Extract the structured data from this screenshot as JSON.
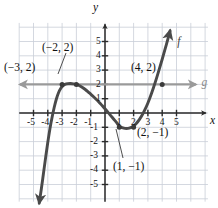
{
  "figure": {
    "background": "#ffffff",
    "width": 218,
    "height": 208
  },
  "axes": {
    "x_name": "x",
    "y_name": "y",
    "origin_px": {
      "x": 105,
      "y": 113
    },
    "unit_px": 14.3,
    "xlim": [
      -6.0,
      7.2
    ],
    "ylim": [
      -6.2,
      6.3
    ],
    "axis_color": "#2b2b2b",
    "grid_color": "#c9ced8",
    "grid": true
  },
  "ticks": {
    "x_labels": [
      "-5",
      "-4",
      "-3",
      "-2",
      "-1",
      "1",
      "2",
      "3",
      "4",
      "5"
    ],
    "x_values": [
      -5,
      -4,
      -3,
      -2,
      -1,
      1,
      2,
      3,
      4,
      5
    ],
    "y_labels": [
      "5",
      "4",
      "3",
      "2",
      "1",
      "-1",
      "-2",
      "-3",
      "-4",
      "-5"
    ],
    "y_values": [
      5,
      4,
      3,
      2,
      1,
      -1,
      -2,
      -3,
      -4,
      -5
    ]
  },
  "curves": {
    "f": {
      "label": "f",
      "color": "#4a4a4a",
      "width": 2.9,
      "label_pos": {
        "x": 5.05,
        "y": 4.95
      },
      "type": "cubic",
      "points": [
        [
          -4.6,
          -6.3
        ],
        [
          -4.45,
          -5.3
        ],
        [
          -4.3,
          -4.2
        ],
        [
          -4.15,
          -3.1
        ],
        [
          -4.0,
          -2.05
        ],
        [
          -3.85,
          -1.1
        ],
        [
          -3.7,
          -0.3
        ],
        [
          -3.55,
          0.4
        ],
        [
          -3.4,
          0.98
        ],
        [
          -3.25,
          1.42
        ],
        [
          -3.1,
          1.72
        ],
        [
          -2.95,
          1.9
        ],
        [
          -2.8,
          2.0
        ],
        [
          -2.6,
          2.05
        ],
        [
          -2.4,
          2.06
        ],
        [
          -2.2,
          2.04
        ],
        [
          -2.0,
          2.0
        ],
        [
          -1.8,
          1.92
        ],
        [
          -1.6,
          1.8
        ],
        [
          -1.4,
          1.66
        ],
        [
          -1.2,
          1.5
        ],
        [
          -1.0,
          1.32
        ],
        [
          -0.8,
          1.14
        ],
        [
          -0.6,
          0.95
        ],
        [
          -0.4,
          0.74
        ],
        [
          -0.2,
          0.52
        ],
        [
          0.0,
          0.3
        ],
        [
          0.2,
          0.06
        ],
        [
          0.4,
          -0.18
        ],
        [
          0.6,
          -0.42
        ],
        [
          0.8,
          -0.66
        ],
        [
          1.0,
          -0.92
        ],
        [
          1.2,
          -1.02
        ],
        [
          1.4,
          -1.08
        ],
        [
          1.6,
          -1.08
        ],
        [
          1.8,
          -1.02
        ],
        [
          2.0,
          -0.92
        ],
        [
          2.2,
          -0.72
        ],
        [
          2.4,
          -0.46
        ],
        [
          2.6,
          -0.14
        ],
        [
          2.8,
          0.25
        ],
        [
          3.0,
          0.7
        ],
        [
          3.2,
          1.22
        ],
        [
          3.4,
          1.8
        ],
        [
          3.6,
          2.42
        ],
        [
          3.8,
          3.08
        ],
        [
          4.0,
          3.76
        ],
        [
          4.2,
          4.46
        ],
        [
          4.4,
          5.18
        ],
        [
          4.55,
          5.75
        ]
      ]
    },
    "g": {
      "label": "g",
      "color": "#9a9a9a",
      "width": 2.4,
      "equation_y": 2,
      "x_start": -5.95,
      "x_end": 6.35,
      "label_pos": {
        "x": 6.75,
        "y": 2.0
      }
    }
  },
  "marked_points": [
    {
      "name": "point-neg2-2",
      "x": -2,
      "y": 2,
      "dot": true
    },
    {
      "name": "point-neg3-2",
      "x": -3,
      "y": 2,
      "dot": true
    },
    {
      "name": "point-4-2",
      "x": 4,
      "y": 2,
      "dot": true
    },
    {
      "name": "point-1-neg1",
      "x": 1,
      "y": -1,
      "dot": true
    },
    {
      "name": "point-2-neg1",
      "x": 2,
      "y": -1,
      "dot": true
    }
  ],
  "annotations": [
    {
      "name": "label-neg3-2",
      "text": "(−3, 2)",
      "px": 4,
      "py": 62,
      "leader": null
    },
    {
      "name": "label-neg2-2",
      "text": "(−2, 2)",
      "px": 42,
      "py": 42,
      "leader": {
        "x1": 66,
        "y1": 53,
        "x2": 58,
        "y2": 74
      }
    },
    {
      "name": "label-4-2",
      "text": "(4, 2)",
      "px": 131,
      "py": 62,
      "leader": null
    },
    {
      "name": "label-2-neg1",
      "text": "(2, −1)",
      "px": 137,
      "py": 127,
      "leader": null
    },
    {
      "name": "label-1-neg1",
      "text": "(1, −1)",
      "px": 113,
      "py": 161,
      "leader": {
        "x1": 123,
        "y1": 158,
        "x2": 116,
        "y2": 129
      }
    }
  ],
  "chart_data": {
    "type": "line",
    "title": "",
    "xlabel": "x",
    "ylabel": "y",
    "xlim": [
      -6.0,
      7.2
    ],
    "ylim": [
      -6.2,
      6.3
    ],
    "grid": true,
    "legend": [
      "f",
      "g"
    ],
    "legend_position": "inline-at-curve-end",
    "series": [
      {
        "name": "f",
        "description": "Cubic curve with local maximum near (-2.4, 2.06) and local minimum near (1.5, -1.08); rises steeply at both ends with arrowheads.",
        "key_points": [
          {
            "x": -3,
            "y": 2
          },
          {
            "x": -2,
            "y": 2
          },
          {
            "x": 1,
            "y": -1
          },
          {
            "x": 2,
            "y": -1
          },
          {
            "x": 4,
            "y": 2
          }
        ]
      },
      {
        "name": "g",
        "description": "Horizontal line y = 2 spanning the plot with arrowheads on both ends.",
        "key_points": [
          {
            "x": -3,
            "y": 2
          },
          {
            "x": -2,
            "y": 2
          },
          {
            "x": 4,
            "y": 2
          }
        ]
      }
    ],
    "intersections": [
      {
        "x": -3,
        "y": 2
      },
      {
        "x": -2,
        "y": 2
      },
      {
        "x": 4,
        "y": 2
      }
    ]
  }
}
